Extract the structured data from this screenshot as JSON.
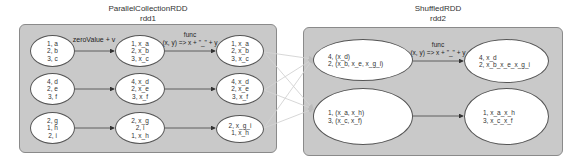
{
  "rdd1": {
    "title": "ParallelCollectionRDD",
    "subtitle": "rdd1",
    "stage1_label": "zeroValue + v",
    "stage2_label_line1": "func",
    "stage2_label_line2": "(x, y) => x + \"_\" + y",
    "rows": [
      {
        "input": [
          "1, a",
          "2, b",
          "3, c"
        ],
        "mapped": [
          "1, x_a",
          "2, x_b",
          "3, x_c"
        ],
        "combined": [
          "1, x_a",
          "2, x_b",
          "3, x_c"
        ]
      },
      {
        "input": [
          "4, d",
          "2, e",
          "3, f"
        ],
        "mapped": [
          "4, x_d",
          "2, x_e",
          "3, x_f"
        ],
        "combined": [
          "4, x_d",
          "2, x_e",
          "3, x_f"
        ]
      },
      {
        "input": [
          "2, g",
          "1, h",
          "2, i"
        ],
        "mapped": [
          "2, x_g",
          "2, i",
          "1, x_h"
        ],
        "combined": [
          "2, x_g_i",
          "1, x_h"
        ]
      }
    ]
  },
  "rdd2": {
    "title": "ShuffledRDD",
    "subtitle": "rdd2",
    "func_label_line1": "func",
    "func_label_line2": "(x, y) => x + \"_\" + y",
    "rows": [
      {
        "grouped": [
          "4, (x_d)",
          "2, (x_b, x_e, x_g_i)"
        ],
        "result": [
          "4, x_d",
          "2, x_b_x_e_x_g_i"
        ]
      },
      {
        "grouped": [
          "1, (x_a, x_h)",
          "3, (x_c, x_f)"
        ],
        "result": [
          "1, x_a_x_h",
          "3, x_c_x_f"
        ]
      }
    ]
  },
  "colors": {
    "box_fill": "#c9c9c9",
    "box_border": "#8a8a8a",
    "arrow": "#444444",
    "shuffle_line": "#d4d4d4"
  }
}
